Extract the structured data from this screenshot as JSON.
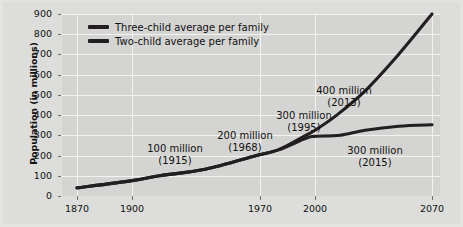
{
  "chart_data": {
    "type": "line",
    "title": "",
    "xlabel": "",
    "ylabel": "Population (in millions)",
    "xlim": [
      1870,
      2070
    ],
    "ylim": [
      0,
      900
    ],
    "grid": true,
    "legend_position": "top-left",
    "xticks": [
      "1870",
      "1900",
      "1970",
      "2000",
      "2070"
    ],
    "xtick_values": [
      1870,
      1900,
      1970,
      2000,
      2070
    ],
    "yticks": [
      "0",
      "100",
      "200",
      "300",
      "400",
      "500",
      "600",
      "700",
      "800",
      "900"
    ],
    "ytick_values": [
      0,
      100,
      200,
      300,
      400,
      500,
      600,
      700,
      800,
      900
    ],
    "series": [
      {
        "name": "Three-child average per family",
        "color": "#231f20",
        "x": [
          1870,
          1900,
          1915,
          1940,
          1968,
          1980,
          1995,
          2000,
          2013,
          2030,
          2050,
          2070
        ],
        "values": [
          40,
          76,
          100,
          132,
          200,
          228,
          300,
          325,
          400,
          520,
          700,
          900
        ]
      },
      {
        "name": "Two-child average per family",
        "color": "#231f20",
        "x": [
          1870,
          1900,
          1915,
          1940,
          1968,
          1980,
          1995,
          2000,
          2015,
          2030,
          2050,
          2070
        ],
        "values": [
          40,
          76,
          100,
          132,
          200,
          228,
          285,
          295,
          300,
          325,
          345,
          352
        ]
      }
    ],
    "annotations": [
      {
        "value": "100 million",
        "year": "(1915)",
        "x_px": 175,
        "y_px": 143
      },
      {
        "value": "200 million",
        "year": "(1968)",
        "x_px": 245,
        "y_px": 130
      },
      {
        "value": "300 million",
        "year": "(1995)",
        "x_px": 304,
        "y_px": 110
      },
      {
        "value": "400 million",
        "year": "(2013)",
        "x_px": 344,
        "y_px": 85
      },
      {
        "value": "300 million",
        "year": "(2015)",
        "x_px": 375,
        "y_px": 145
      }
    ]
  },
  "legend": {
    "items": [
      {
        "label": "Three-child average per family"
      },
      {
        "label": "Two-child average per family"
      }
    ]
  }
}
